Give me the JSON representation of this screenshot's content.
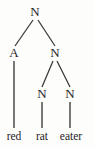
{
  "figure": {
    "type": "syntax-parse-tree",
    "background_color": "#fdfdfc",
    "stroke_color": "#3a3733",
    "text_color": "#25231f",
    "sentence": "red rat eater"
  },
  "nodes": [
    {
      "id": "root",
      "label": "N",
      "x": 35,
      "y": 12,
      "level": 0
    },
    {
      "id": "adj",
      "label": "A",
      "x": 14,
      "y": 53,
      "level": 1
    },
    {
      "id": "n-mid",
      "label": "N",
      "x": 55,
      "y": 53,
      "level": 1
    },
    {
      "id": "n-rat",
      "label": "N",
      "x": 42,
      "y": 94,
      "level": 2
    },
    {
      "id": "n-eater",
      "label": "N",
      "x": 70,
      "y": 94,
      "level": 2
    }
  ],
  "leaves": [
    {
      "id": "leaf-red",
      "label": "red",
      "x": 14,
      "y": 137,
      "parent": "adj"
    },
    {
      "id": "leaf-rat",
      "label": "rat",
      "x": 42,
      "y": 137,
      "parent": "n-rat"
    },
    {
      "id": "leaf-eater",
      "label": "eater",
      "x": 71,
      "y": 137,
      "parent": "n-eater"
    }
  ],
  "edges": [
    {
      "id": "edge-root-adj",
      "from": "root",
      "to": "adj",
      "x1": 33,
      "y1": 20,
      "x2": 15,
      "y2": 46,
      "kind": "branch"
    },
    {
      "id": "edge-root-nmid",
      "from": "root",
      "to": "n-mid",
      "x1": 38,
      "y1": 20,
      "x2": 55,
      "y2": 46,
      "kind": "branch"
    },
    {
      "id": "edge-nmid-nrat",
      "from": "n-mid",
      "to": "n-rat",
      "x1": 53,
      "y1": 61,
      "x2": 42,
      "y2": 87,
      "kind": "branch"
    },
    {
      "id": "edge-nmid-neater",
      "from": "n-mid",
      "to": "n-eater",
      "x1": 57,
      "y1": 61,
      "x2": 70,
      "y2": 87,
      "kind": "branch"
    },
    {
      "id": "edge-adj-red",
      "from": "adj",
      "to": "leaf-red",
      "x1": 14,
      "y1": 61,
      "x2": 14,
      "y2": 128,
      "kind": "stem"
    },
    {
      "id": "edge-nrat-rat",
      "from": "n-rat",
      "to": "leaf-rat",
      "x1": 42,
      "y1": 102,
      "x2": 42,
      "y2": 128,
      "kind": "stem"
    },
    {
      "id": "edge-neater-eater",
      "from": "n-eater",
      "to": "leaf-eater",
      "x1": 70,
      "y1": 102,
      "x2": 70,
      "y2": 128,
      "kind": "stem"
    }
  ]
}
